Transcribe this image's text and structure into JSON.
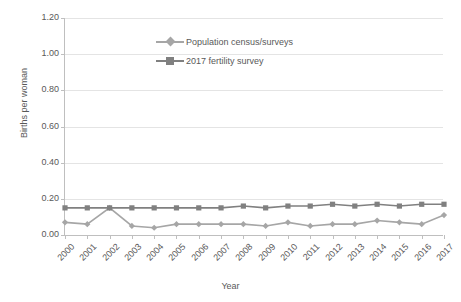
{
  "chart_data": {
    "type": "line",
    "title": "",
    "xlabel": "Year",
    "ylabel": "Births per woman",
    "categories": [
      "2000",
      "2001",
      "2002",
      "2003",
      "2004",
      "2005",
      "2006",
      "2007",
      "2008",
      "2009",
      "2010",
      "2011",
      "2012",
      "2013",
      "2014",
      "2015",
      "2016",
      "2017"
    ],
    "ylim": [
      0.0,
      1.2
    ],
    "ytick_labels": [
      "1.20",
      "1.00",
      "0.80",
      "0.60",
      "0.40",
      "0.20",
      "0.00"
    ],
    "ytick_values": [
      1.2,
      1.0,
      0.8,
      0.6,
      0.4,
      0.2,
      0.0
    ],
    "grid": true,
    "grid_axis": "y",
    "legend_position": "top-center",
    "series": [
      {
        "name": "Population census/surveys",
        "color": "#a6a6a6",
        "marker": "diamond",
        "values": [
          0.07,
          0.06,
          0.15,
          0.05,
          0.04,
          0.06,
          0.06,
          0.06,
          0.06,
          0.05,
          0.07,
          0.05,
          0.06,
          0.06,
          0.08,
          0.07,
          0.06,
          0.11
        ]
      },
      {
        "name": "2017 fertility survey",
        "color": "#808080",
        "marker": "square",
        "values": [
          0.15,
          0.15,
          0.15,
          0.15,
          0.15,
          0.15,
          0.15,
          0.15,
          0.16,
          0.15,
          0.16,
          0.16,
          0.17,
          0.16,
          0.17,
          0.16,
          0.17,
          0.17
        ]
      }
    ]
  },
  "legend": {
    "items": [
      {
        "label": "Population census/surveys"
      },
      {
        "label": "2017 fertility survey"
      }
    ]
  },
  "axis": {
    "y_title": "Births per woman",
    "x_title": "Year"
  }
}
